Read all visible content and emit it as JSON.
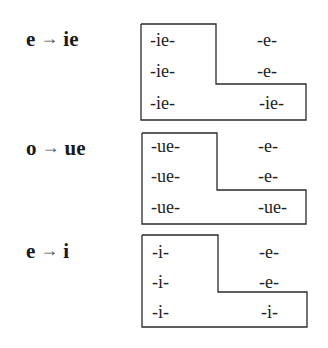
{
  "groups": [
    {
      "from": "e",
      "arrow": "→",
      "to": "ie",
      "rows": [
        {
          "left": "-ie-",
          "right": "-e-"
        },
        {
          "left": "-ie-",
          "right": "-e-"
        },
        {
          "left": "-ie-",
          "right": "-ie-"
        }
      ]
    },
    {
      "from": "o",
      "arrow": "→",
      "to": "ue",
      "rows": [
        {
          "left": "-ue-",
          "right": "-e-"
        },
        {
          "left": "-ue-",
          "right": "-e-"
        },
        {
          "left": "-ue-",
          "right": "-ue-"
        }
      ]
    },
    {
      "from": "e",
      "arrow": "→",
      "to": "i",
      "rows": [
        {
          "left": "-i-",
          "right": "-e-"
        },
        {
          "left": "-i-",
          "right": "-e-"
        },
        {
          "left": "-i-",
          "right": "-i-"
        }
      ]
    }
  ]
}
